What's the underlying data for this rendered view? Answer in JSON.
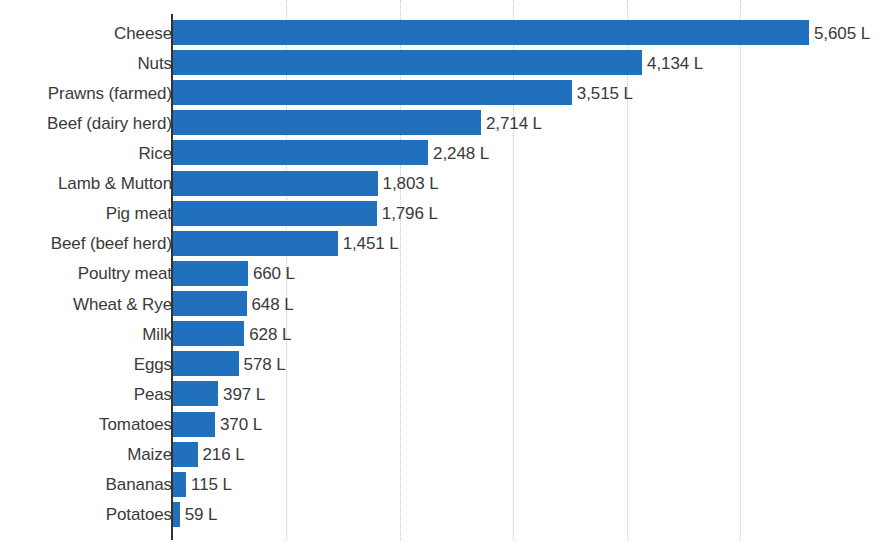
{
  "chart_data": {
    "type": "bar",
    "orientation": "horizontal",
    "title": "",
    "subtitle": "",
    "xlabel": "",
    "ylabel": "",
    "unit": "L",
    "value_suffix": " L",
    "xlim": [
      0,
      6350
    ],
    "grid": true,
    "grid_axis": "x",
    "gridline_values": [
      1000,
      2000,
      3000,
      4000,
      5000
    ],
    "xtick_labels": [],
    "legend": null,
    "bar_color": "#2070be",
    "text_color": "#3a3a3a",
    "gridline_color": "#c9c9c9",
    "axis_color": "#333333",
    "background": "#ffffff",
    "categories": [
      "Cheese",
      "Nuts",
      "Prawns (farmed)",
      "Beef (dairy herd)",
      "Rice",
      "Lamb & Mutton",
      "Pig meat",
      "Beef (beef herd)",
      "Poultry meat",
      "Wheat & Rye",
      "Milk",
      "Eggs",
      "Peas",
      "Tomatoes",
      "Maize",
      "Bananas",
      "Potatoes"
    ],
    "values": [
      5605,
      4134,
      3515,
      2714,
      2248,
      1803,
      1796,
      1451,
      660,
      648,
      628,
      578,
      397,
      370,
      216,
      115,
      59
    ],
    "value_labels": [
      "5,605 L",
      "4,134 L",
      "3,515 L",
      "2,714 L",
      "2,248 L",
      "1,803 L",
      "1,796 L",
      "1,451 L",
      "660 L",
      "648 L",
      "628 L",
      "578 L",
      "397 L",
      "370 L",
      "216 L",
      "115 L",
      "59 L"
    ]
  }
}
